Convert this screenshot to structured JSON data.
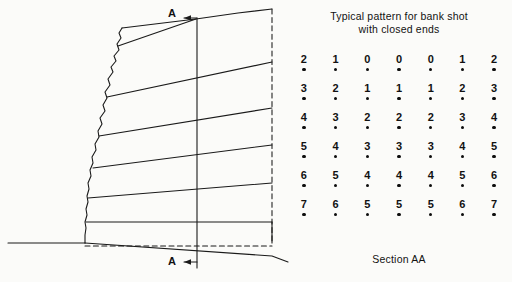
{
  "figure": {
    "section_marker_top": "A",
    "section_marker_bottom": "A"
  },
  "right_panel": {
    "title_line1": "Typical pattern for bank shot",
    "title_line2": "with closed ends",
    "caption": "Section AA"
  },
  "chart_data": {
    "type": "table",
    "title": "Typical pattern for bank shot with closed ends",
    "subtitle": "Section AA",
    "rows": 6,
    "columns": 7,
    "values": [
      [
        2,
        1,
        0,
        0,
        0,
        1,
        2
      ],
      [
        3,
        2,
        1,
        1,
        1,
        2,
        3
      ],
      [
        4,
        3,
        2,
        2,
        2,
        3,
        4
      ],
      [
        5,
        4,
        3,
        3,
        3,
        4,
        5
      ],
      [
        6,
        5,
        4,
        4,
        4,
        5,
        6
      ],
      [
        7,
        6,
        5,
        5,
        5,
        6,
        7
      ]
    ],
    "marker": "blasthole-dot",
    "legend": [],
    "grid": false
  },
  "colors": {
    "ink": "#141414",
    "paper": "#fbfbf9",
    "dot": "#0d0d0d"
  }
}
